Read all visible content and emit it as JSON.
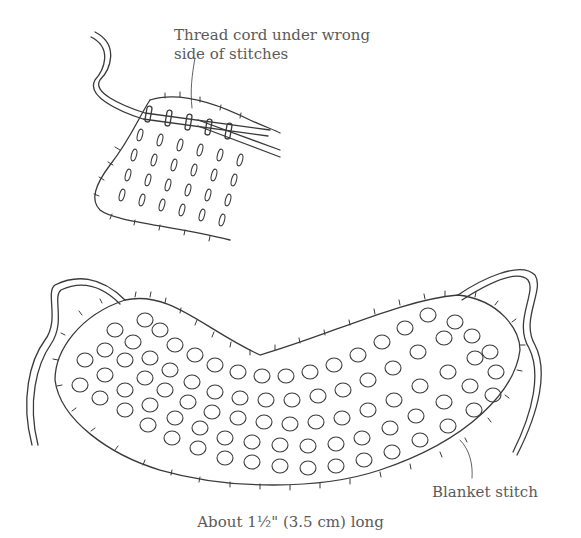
{
  "figure": {
    "top_illustration": {
      "label_line1": "Thread cord under wrong",
      "label_line2": "side of stitches"
    },
    "bottom_illustration": {
      "label": "Blanket stitch"
    },
    "caption": "About 1½\" (3.5 cm) long"
  },
  "colors": {
    "ink": "#3a3a3a",
    "text": "#5a5a5a",
    "background": "#ffffff"
  }
}
